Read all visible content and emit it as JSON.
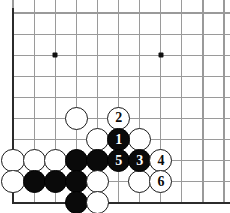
{
  "diagram": {
    "kind": "go-board-problem-diagram",
    "board": {
      "background_color": "#ffffff",
      "line_color": "#9a9a9a",
      "edge_color": "#2b2b2b",
      "star_color": "#111111",
      "origin_x": 13,
      "origin_y": 13,
      "spacing": 21.1,
      "cols": 10,
      "rows": 9,
      "edges_drawn": [
        "left",
        "bottom"
      ],
      "star_points": [
        {
          "name": "star-point-upper-left",
          "col": 2,
          "row": 2
        },
        {
          "name": "star-point-upper-right",
          "col": 7,
          "row": 2
        },
        {
          "name": "star-point-lower-right",
          "col": 7,
          "row": 7
        }
      ]
    },
    "stones": [
      {
        "name": "white-stone-a",
        "color": "white",
        "col": 3,
        "row": 5,
        "label": ""
      },
      {
        "name": "white-stone-b",
        "color": "white",
        "col": 4,
        "row": 6,
        "label": ""
      },
      {
        "name": "white-stone-2",
        "color": "white",
        "col": 5,
        "row": 5,
        "label": "2"
      },
      {
        "name": "white-stone-c",
        "color": "white",
        "col": 6,
        "row": 6,
        "label": ""
      },
      {
        "name": "black-stone-1",
        "color": "black",
        "col": 5,
        "row": 6,
        "label": "1"
      },
      {
        "name": "white-stone-d",
        "color": "white",
        "col": 0,
        "row": 7,
        "label": ""
      },
      {
        "name": "white-stone-e",
        "color": "white",
        "col": 1,
        "row": 7,
        "label": ""
      },
      {
        "name": "white-stone-f",
        "color": "white",
        "col": 2,
        "row": 7,
        "label": ""
      },
      {
        "name": "black-stone-g",
        "color": "black",
        "col": 3,
        "row": 7,
        "label": ""
      },
      {
        "name": "black-stone-h",
        "color": "black",
        "col": 4,
        "row": 7,
        "label": ""
      },
      {
        "name": "black-stone-5",
        "color": "black",
        "col": 5,
        "row": 7,
        "label": "5"
      },
      {
        "name": "black-stone-3",
        "color": "black",
        "col": 6,
        "row": 7,
        "label": "3"
      },
      {
        "name": "white-stone-4",
        "color": "white",
        "col": 7,
        "row": 7,
        "label": "4"
      },
      {
        "name": "white-stone-i",
        "color": "white",
        "col": 0,
        "row": 8,
        "label": ""
      },
      {
        "name": "black-stone-j",
        "color": "black",
        "col": 1,
        "row": 8,
        "label": ""
      },
      {
        "name": "black-stone-k",
        "color": "black",
        "col": 2,
        "row": 8,
        "label": ""
      },
      {
        "name": "black-stone-l",
        "color": "black",
        "col": 3,
        "row": 8,
        "label": ""
      },
      {
        "name": "white-stone-m",
        "color": "white",
        "col": 4,
        "row": 8,
        "label": ""
      },
      {
        "name": "white-stone-6",
        "color": "white",
        "col": 7,
        "row": 8,
        "label": "6"
      },
      {
        "name": "white-stone-n",
        "color": "white",
        "col": 6,
        "row": 8,
        "label": ""
      },
      {
        "name": "black-stone-o",
        "color": "black",
        "col": 3,
        "row": 9,
        "label": ""
      },
      {
        "name": "white-stone-p",
        "color": "white",
        "col": 4,
        "row": 9,
        "label": ""
      }
    ]
  }
}
